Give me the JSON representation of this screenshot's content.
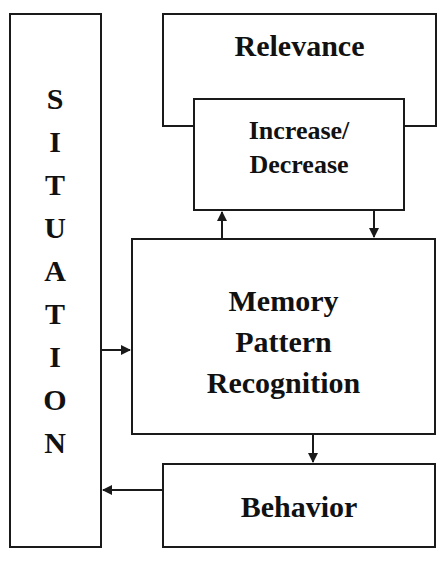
{
  "diagram": {
    "situation": {
      "label": "SITUATION",
      "letters": [
        "S",
        "I",
        "T",
        "U",
        "A",
        "T",
        "I",
        "O",
        "N"
      ]
    },
    "relevance": {
      "label": "Relevance"
    },
    "increase_decrease": {
      "line1": "Increase/",
      "line2": "Decrease"
    },
    "memory": {
      "line1": "Memory",
      "line2": "Pattern",
      "line3": "Recognition"
    },
    "behavior": {
      "label": "Behavior"
    },
    "edges": [
      {
        "from": "Situation",
        "to": "Memory Pattern Recognition"
      },
      {
        "from": "Memory Pattern Recognition",
        "to": "Increase/Decrease"
      },
      {
        "from": "Increase/Decrease",
        "to": "Memory Pattern Recognition"
      },
      {
        "from": "Memory Pattern Recognition",
        "to": "Behavior"
      },
      {
        "from": "Behavior",
        "to": "Situation"
      }
    ],
    "colors": {
      "stroke": "#1a1a1a",
      "background": "#ffffff"
    }
  }
}
